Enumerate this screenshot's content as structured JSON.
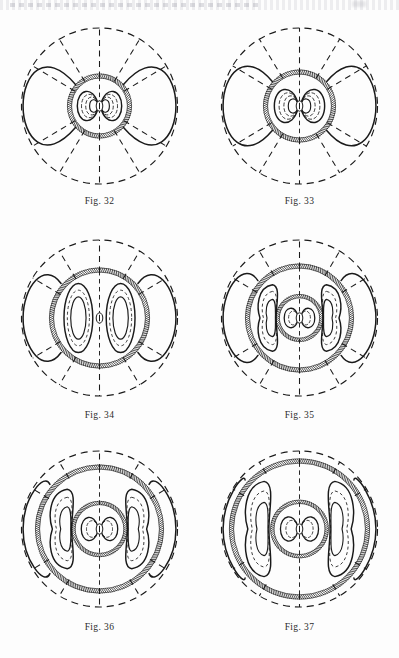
{
  "page": {
    "background_color": "#fdfdfd",
    "ink_color": "#1a1a1a",
    "header_fragment": "",
    "figure_count": 6
  },
  "figures": [
    {
      "id": "fig32",
      "caption": "Fig. 32",
      "col": 0,
      "row": 0,
      "outer_radius": 78,
      "spoke_count": 8,
      "core_radius": 30,
      "shells": 1,
      "lobe_type": "butterfly",
      "lobe_count": 2,
      "outer_lobe_arcs": 2,
      "has_nucleus": true
    },
    {
      "id": "fig33",
      "caption": "Fig. 33",
      "col": 1,
      "row": 0,
      "outer_radius": 78,
      "spoke_count": 8,
      "core_radius": 34,
      "shells": 1,
      "lobe_type": "butterfly",
      "lobe_count": 2,
      "outer_lobe_arcs": 2,
      "has_nucleus": true
    },
    {
      "id": "fig34",
      "caption": "Fig. 34",
      "col": 0,
      "row": 1,
      "outer_radius": 78,
      "spoke_count": 8,
      "core_radius": 48,
      "shells": 1,
      "lobe_type": "oval-pair",
      "lobe_count": 2,
      "outer_lobe_arcs": 2,
      "has_nucleus": true
    },
    {
      "id": "fig35",
      "caption": "Fig. 35",
      "col": 1,
      "row": 1,
      "outer_radius": 78,
      "spoke_count": 8,
      "core_radius": 52,
      "shells": 2,
      "lobe_type": "kidney-pair",
      "lobe_count": 2,
      "outer_lobe_arcs": 2,
      "has_nucleus": true
    },
    {
      "id": "fig36",
      "caption": "Fig. 36",
      "col": 0,
      "row": 2,
      "outer_radius": 78,
      "spoke_count": 8,
      "core_radius": 62,
      "shells": 2,
      "lobe_type": "kidney-pair",
      "lobe_count": 2,
      "outer_lobe_arcs": 2,
      "has_nucleus": true
    },
    {
      "id": "fig37",
      "caption": "Fig. 37",
      "col": 1,
      "row": 2,
      "outer_radius": 78,
      "spoke_count": 8,
      "core_radius": 68,
      "shells": 2,
      "lobe_type": "kidney-pair-tall",
      "lobe_count": 2,
      "outer_lobe_arcs": 2,
      "has_nucleus": true
    }
  ],
  "bleed_text": {
    "row2_left": "",
    "row3_mid": ""
  }
}
